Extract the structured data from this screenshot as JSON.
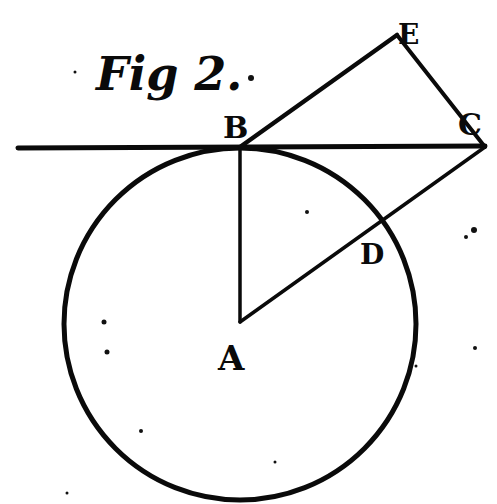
{
  "figure": {
    "title": "Fig 2.",
    "ink_color": "#0a0a0a",
    "paper_color": "#ffffff"
  },
  "points": {
    "A": {
      "label": "A",
      "x": 240,
      "y": 322
    },
    "B": {
      "label": "B",
      "x": 240,
      "y": 147
    },
    "C": {
      "label": "C",
      "x": 485,
      "y": 147
    },
    "D": {
      "label": "D",
      "x": 384,
      "y": 226
    },
    "E": {
      "label": "E",
      "x": 397,
      "y": 35
    }
  },
  "circle": {
    "center": "A",
    "radius": 175
  },
  "segments": [
    {
      "name": "tangent-line",
      "from": [
        17,
        147
      ],
      "to": [
        485,
        147
      ]
    },
    {
      "name": "radius-AB",
      "from": "A",
      "to": "B"
    },
    {
      "name": "line-AC",
      "from": "A",
      "to": "C"
    },
    {
      "name": "line-BE",
      "from": "B",
      "to": "E"
    },
    {
      "name": "line-EC",
      "from": "E",
      "to": "C"
    }
  ]
}
